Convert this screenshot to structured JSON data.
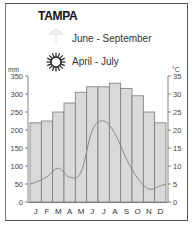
{
  "title": "TAMPA",
  "legend": {
    "rain_season": {
      "icon": "umbrella-icon",
      "label": "June - September"
    },
    "sun_season": {
      "icon": "sun-icon",
      "label": "April - July"
    }
  },
  "axes": {
    "left_unit": "mm",
    "right_unit": "°C",
    "left_ticks": [
      "350",
      "300",
      "250",
      "200",
      "150",
      "100",
      "50",
      "0"
    ],
    "right_ticks": [
      "35",
      "30",
      "25",
      "20",
      "15",
      "10",
      "5",
      "0"
    ]
  },
  "chart_data": {
    "type": "bar",
    "title": "TAMPA",
    "categories": [
      "J",
      "F",
      "M",
      "A",
      "M",
      "J",
      "J",
      "A",
      "S",
      "O",
      "N",
      "D"
    ],
    "series": [
      {
        "name": "Temperature (°C)",
        "type": "bar",
        "axis": "right",
        "values": [
          22,
          22.5,
          25,
          27.5,
          30.5,
          32,
          32,
          33,
          31.5,
          29.5,
          25,
          22
        ]
      },
      {
        "name": "Precipitation (mm)",
        "type": "line",
        "axis": "left",
        "values": [
          55,
          70,
          94,
          69,
          83,
          200,
          225,
          190,
          120,
          66,
          36,
          45
        ]
      }
    ],
    "ylabel_left": "mm",
    "ylabel_right": "°C",
    "ylim_left": [
      0,
      350
    ],
    "ylim_right": [
      0,
      35
    ],
    "grid": false,
    "colors": {
      "bar_fill": "#d9d9d9",
      "bar_stroke": "#7a7a7a",
      "line": "#8a8a8a"
    }
  }
}
